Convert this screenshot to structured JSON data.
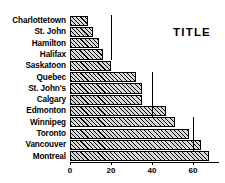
{
  "chart_data": {
    "type": "bar",
    "orientation": "horizontal",
    "title": "TITLE",
    "xlabel": "",
    "ylabel": "",
    "xlim": [
      0,
      72
    ],
    "ylim": null,
    "grid": false,
    "legend": null,
    "xticks": [
      0,
      20,
      40,
      60
    ],
    "xtick_labels": [
      "0",
      "20",
      "40",
      "60"
    ],
    "categories": [
      "Charlottetown",
      "St. John",
      "Hamilton",
      "Halifax",
      "Saskatoon",
      "Quebec",
      "St. John's",
      "Calgary",
      "Edmonton",
      "Winnipeg",
      "Toronto",
      "Vancouver",
      "Montreal"
    ],
    "values": [
      9,
      11,
      14,
      16,
      20,
      32,
      35,
      35,
      47,
      51,
      58,
      64,
      68
    ],
    "annotations": [
      {
        "name": "dropline-20",
        "x": 20,
        "from_row": 0,
        "to_row": 3
      },
      {
        "name": "dropline-40",
        "x": 40,
        "from_row": 5,
        "to_row": 8
      },
      {
        "name": "dropline-60",
        "x": 60,
        "from_row": 9,
        "to_row": 11
      }
    ],
    "colors": {
      "bar_fill": "#d8d8d8",
      "bar_hatch": "#000000",
      "bar_edge": "#000000",
      "axis": "#000000",
      "text": "#000000",
      "background": "#ffffff"
    }
  }
}
